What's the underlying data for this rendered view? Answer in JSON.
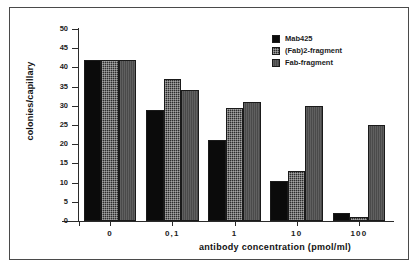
{
  "chart_data": {
    "type": "bar",
    "title": "",
    "subtitle": "",
    "xlabel": "antibody  concentration  (pmol/ml)",
    "ylabel": "colonies/capillary",
    "categories": [
      "0",
      "0,1",
      "1",
      "10",
      "100"
    ],
    "series": [
      {
        "name": "Mab425",
        "values": [
          42,
          29,
          21,
          10.5,
          2
        ]
      },
      {
        "name": "(Fab)2-fragment",
        "values": [
          42,
          37,
          29.5,
          13,
          1
        ]
      },
      {
        "name": "Fab-fragment",
        "values": [
          42,
          34,
          31,
          30,
          25
        ]
      }
    ],
    "ylim": [
      0,
      50
    ],
    "yticks": [
      0,
      5,
      10,
      15,
      20,
      25,
      30,
      35,
      40,
      45,
      50
    ],
    "ytick_labels": [
      "0",
      "5",
      "10",
      "15",
      "20",
      "25",
      "30",
      "35",
      "40",
      "45",
      "50"
    ],
    "grid": false,
    "legend_position": "top-right",
    "colors": {
      "series_0": "#0b0b0b",
      "series_1": "#2d2d2d",
      "series_2": "#4e4e4e",
      "axis": "#2b2b2b",
      "text": "#1b1b1b",
      "background": "#ffffff",
      "frame": "#4a4a4a"
    }
  }
}
